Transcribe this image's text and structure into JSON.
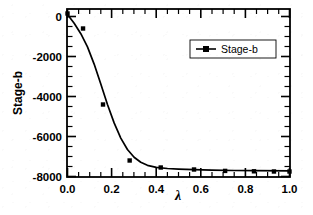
{
  "chart_data": {
    "type": "scatter",
    "title": "",
    "subtitle": "",
    "xlabel": "λ",
    "ylabel": "Stage-b",
    "xlim": [
      0.0,
      1.0
    ],
    "ylim": [
      -8000,
      500
    ],
    "xticks": [
      "0.0",
      "0.2",
      "0.4",
      "0.6",
      "0.8",
      "1.0"
    ],
    "xtick_values": [
      0.0,
      0.2,
      0.4,
      0.6,
      0.8,
      1.0
    ],
    "yticks": [
      "0",
      "-2000",
      "-4000",
      "-6000",
      "-8000"
    ],
    "ytick_values": [
      0,
      -2000,
      -4000,
      -6000,
      -8000
    ],
    "grid": false,
    "legend_position": "upper right",
    "legend": [
      "Stage-b"
    ],
    "marker": "square",
    "color": "#000000",
    "series": [
      {
        "name": "Stage-b",
        "x": [
          0.0,
          0.07,
          0.16,
          0.28,
          0.42,
          0.57,
          0.71,
          0.84,
          0.93,
          1.0
        ],
        "values": [
          150,
          -600,
          -4400,
          -7200,
          -7550,
          -7650,
          -7720,
          -7740,
          -7750,
          -7750
        ]
      }
    ],
    "fit_curve": {
      "name": "sigmoidal fit",
      "x": [
        0.0,
        0.03,
        0.06,
        0.09,
        0.12,
        0.15,
        0.18,
        0.21,
        0.24,
        0.27,
        0.3,
        0.33,
        0.36,
        0.4,
        0.45,
        0.5,
        0.57,
        0.65,
        0.75,
        0.85,
        1.0
      ],
      "values": [
        100,
        -340,
        -860,
        -1520,
        -2380,
        -3380,
        -4400,
        -5320,
        -6080,
        -6650,
        -7040,
        -7290,
        -7440,
        -7540,
        -7600,
        -7630,
        -7660,
        -7680,
        -7700,
        -7710,
        -7720
      ]
    }
  },
  "axes": {
    "y_title": "Stage-b",
    "x_title": "λ"
  },
  "legend_entry": {
    "label": "Stage-b"
  }
}
